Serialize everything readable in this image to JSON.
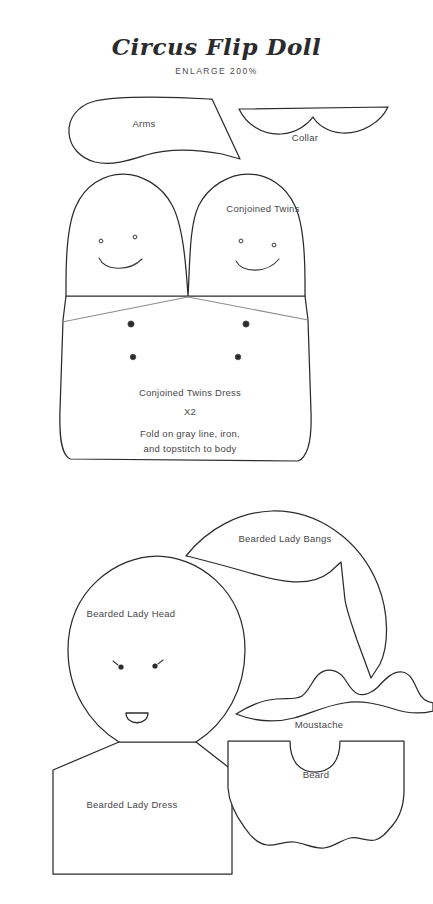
{
  "document": {
    "title": "Circus Flip Doll",
    "subtitle": "ENLARGE 200%",
    "background_color": "#ffffff",
    "line_color": "#2b2b2d",
    "fold_line_color": "#8d8d92",
    "text_color": "#46464a"
  },
  "pieces": {
    "arms": {
      "label": "Arms"
    },
    "collar": {
      "label": "Collar"
    },
    "conjoined_twins": {
      "label": "Conjoined Twins"
    },
    "conjoined_twins_dress": {
      "label": "Conjoined Twins Dress",
      "quantity": "X2",
      "instruction_line_1": "Fold on gray line, iron,",
      "instruction_line_2": "and topstitch to body",
      "button_count": 4
    },
    "bearded_lady_bangs": {
      "label": "Bearded Lady Bangs"
    },
    "bearded_lady_head": {
      "label": "Bearded Lady Head"
    },
    "bearded_lady_dress": {
      "label": "Bearded Lady Dress"
    },
    "moustache": {
      "label": "Moustache"
    },
    "beard": {
      "label": "Beard"
    }
  }
}
